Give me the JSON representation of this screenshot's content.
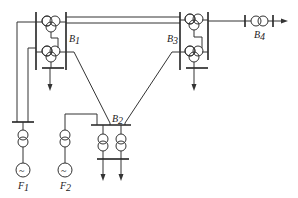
{
  "diagram": {
    "type": "power-system-single-line-diagram",
    "colors": {
      "line": "#333333",
      "background": "#ffffff"
    },
    "labels": {
      "B1": {
        "main": "B",
        "sub": "1"
      },
      "B2": {
        "main": "B",
        "sub": "2"
      },
      "B3": {
        "main": "B",
        "sub": "3"
      },
      "B4": {
        "main": "B",
        "sub": "4"
      },
      "F1": {
        "main": "F",
        "sub": "1"
      },
      "F2": {
        "main": "F",
        "sub": "2"
      }
    },
    "generator_symbol": "~",
    "components": [
      {
        "id": "B1",
        "kind": "substation",
        "transformers": 2,
        "transformer_type": "three-winding",
        "loads": 1
      },
      {
        "id": "B3",
        "kind": "substation",
        "transformers": 2,
        "transformer_type": "three-winding",
        "loads": 1
      },
      {
        "id": "B2",
        "kind": "substation",
        "transformers": 2,
        "transformer_type": "two-winding",
        "loads": 2
      },
      {
        "id": "B4",
        "kind": "transformer",
        "transformer_type": "two-winding",
        "loads": 1
      },
      {
        "id": "F1",
        "kind": "generator",
        "step_up": "two-winding transformer"
      },
      {
        "id": "F2",
        "kind": "generator",
        "step_up": "two-winding transformer"
      }
    ],
    "connections": [
      [
        "B1",
        "B3",
        "double line"
      ],
      [
        "B1",
        "B2"
      ],
      [
        "B3",
        "B2"
      ],
      [
        "B3",
        "B4"
      ],
      [
        "F1",
        "B1"
      ],
      [
        "F2",
        "B2"
      ]
    ]
  }
}
